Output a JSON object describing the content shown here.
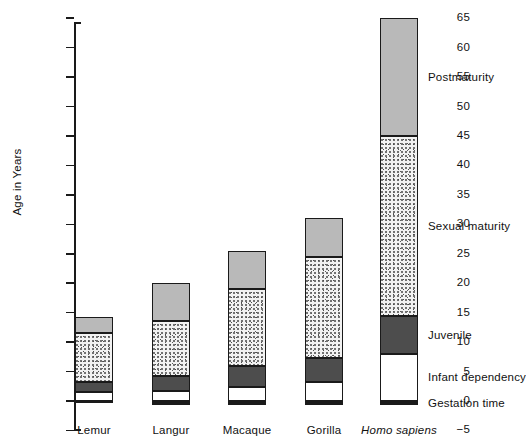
{
  "chart_data": {
    "type": "bar",
    "subtype": "stacked-bar-with-negative-base",
    "title": "",
    "xlabel": "",
    "ylabel": "Age in Years",
    "ylim": [
      -5,
      65
    ],
    "ytick_step": 5,
    "yticks": [
      -5,
      0,
      5,
      10,
      15,
      20,
      25,
      30,
      35,
      40,
      45,
      50,
      55,
      60,
      65
    ],
    "ytick_labels": [
      "−5",
      "0",
      "5",
      "10",
      "15",
      "20",
      "25",
      "30",
      "35",
      "40",
      "45",
      "50",
      "55",
      "60",
      "65"
    ],
    "grid": false,
    "legend_position": "inline-right-of-last-bar",
    "categories": [
      "Lemur",
      "Langur",
      "Macaque",
      "Gorilla",
      "Homo sapiens"
    ],
    "category_styles": [
      "normal",
      "normal",
      "normal",
      "normal",
      "italic"
    ],
    "series": [
      {
        "name": "Gestation time",
        "color": "#1a1a1a",
        "fill": "solid-black",
        "starts": [
          -0.4,
          -0.6,
          -0.6,
          -0.75,
          -0.75
        ],
        "values": [
          0.4,
          0.6,
          0.6,
          0.75,
          0.75
        ]
      },
      {
        "name": "Infant dependency",
        "color": "#ffffff",
        "fill": "white",
        "starts": [
          0,
          0,
          0,
          0,
          0
        ],
        "values": [
          1.5,
          1.7,
          2.3,
          3.2,
          8.0
        ]
      },
      {
        "name": "Juvenile",
        "color": "#4d4d4d",
        "fill": "solid-dark-grey",
        "starts": [
          1.5,
          1.7,
          2.3,
          3.2,
          8.0
        ],
        "values": [
          1.8,
          2.6,
          3.7,
          4.1,
          6.5
        ]
      },
      {
        "name": "Sexual maturity",
        "color": "#f2f2f2",
        "fill": "stipple-dots",
        "starts": [
          3.3,
          4.3,
          6.0,
          7.3,
          14.5
        ],
        "values": [
          8.2,
          9.2,
          13.0,
          17.2,
          30.5
        ]
      },
      {
        "name": "Postmaturity",
        "color": "#b9b9b9",
        "fill": "solid-light-grey",
        "starts": [
          11.5,
          13.5,
          19.0,
          24.5,
          45.0
        ],
        "values": [
          2.8,
          6.5,
          6.5,
          6.5,
          20.0
        ]
      }
    ],
    "totals": [
      14.3,
      20.0,
      25.5,
      31.0,
      65.0
    ],
    "legend_entries": [
      {
        "label": "Postmaturity",
        "color": "#b9b9b9"
      },
      {
        "label": "Sexual maturity",
        "color": "#f2f2f2"
      },
      {
        "label": "Juvenile",
        "color": "#4d4d4d"
      },
      {
        "label": "Infant dependency",
        "color": "#ffffff"
      },
      {
        "label": "Gestation time",
        "color": "#1a1a1a"
      }
    ]
  }
}
